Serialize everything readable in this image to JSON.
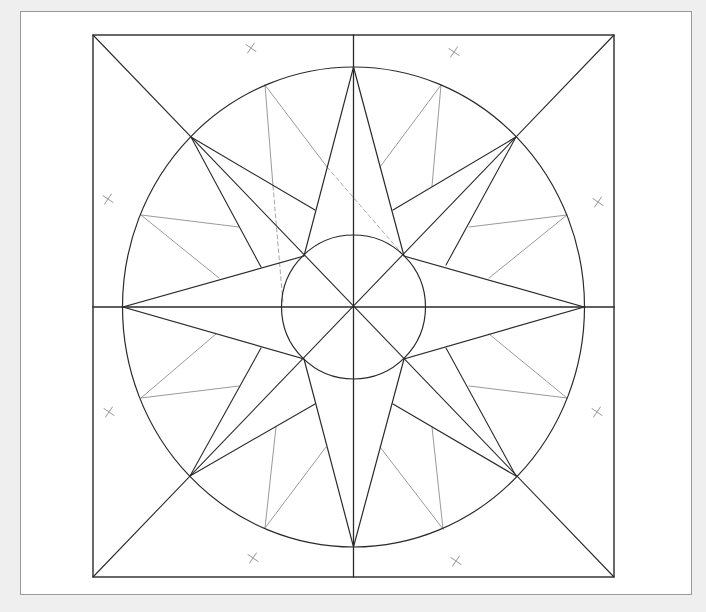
{
  "diagram": {
    "colors": {
      "background": "#efefef",
      "panel": "#ffffff",
      "panel_border": "#9a9a9a",
      "main_stroke": "#2a2a2a",
      "guide_stroke": "#9a9a9a",
      "dashed_stroke": "#a8a8a8",
      "registration_mark": "#a0a0a0"
    },
    "center": [
      353.5,
      307
    ],
    "square": {
      "x1": 93,
      "y1": 35,
      "x2": 614,
      "y2": 577
    },
    "outer_ellipse": {
      "cx": 353.5,
      "cy": 307,
      "rx": 231,
      "ry": 240
    },
    "inner_circle": {
      "cx": 353.5,
      "cy": 307,
      "r": 72
    },
    "axis_lines": [
      [
        353.5,
        35,
        353.5,
        577
      ],
      [
        93,
        307,
        614,
        307
      ]
    ],
    "diagonal_lines": [
      [
        93,
        35,
        614,
        577
      ],
      [
        614,
        35,
        93,
        577
      ]
    ],
    "main_star": {
      "description": "4-point star, cardinal tips on outer circle, inner vertices on inner circle diagonals",
      "polygon": [
        [
          353.5,
          67
        ],
        [
          404,
          256
        ],
        [
          584,
          307
        ],
        [
          404,
          359
        ],
        [
          353.5,
          547
        ],
        [
          304,
          359
        ],
        [
          123,
          307
        ],
        [
          304,
          256
        ]
      ]
    },
    "secondary_star": {
      "description": "diagonal points with base lines to main star arms",
      "points": [
        {
          "name": "NW",
          "tip": [
            191,
            137
          ],
          "bases": [
            [
              261,
              267
            ],
            [
              315,
              210
            ]
          ]
        },
        {
          "name": "NE",
          "tip": [
            516,
            137
          ],
          "bases": [
            [
              393,
              210
            ],
            [
              446,
              265
            ]
          ]
        },
        {
          "name": "SW",
          "tip": [
            190,
            476
          ],
          "bases": [
            [
              261,
              348
            ],
            [
              315,
              404
            ]
          ]
        },
        {
          "name": "SE",
          "tip": [
            516,
            476
          ],
          "bases": [
            [
              393,
              404
            ],
            [
              446,
              348
            ]
          ]
        }
      ]
    },
    "guide_points": [
      {
        "tip": [
          265,
          85
        ],
        "bases": [
          [
            273,
            186
          ],
          [
            327,
            167
          ]
        ]
      },
      {
        "tip": [
          441,
          85
        ],
        "bases": [
          [
            380,
            167
          ],
          [
            432,
            186
          ]
        ]
      },
      {
        "tip": [
          567,
          215
        ],
        "bases": [
          [
            469,
            227
          ],
          [
            489,
            278
          ]
        ]
      },
      {
        "tip": [
          567,
          398
        ],
        "bases": [
          [
            469,
            386
          ],
          [
            489,
            334
          ]
        ]
      },
      {
        "tip": [
          443,
          529
        ],
        "bases": [
          [
            432,
            427
          ],
          [
            380,
            447
          ]
        ]
      },
      {
        "tip": [
          265,
          528
        ],
        "bases": [
          [
            276,
            427
          ],
          [
            326,
            447
          ]
        ]
      },
      {
        "tip": [
          141,
          398
        ],
        "bases": [
          [
            216,
            334
          ],
          [
            239,
            386
          ]
        ]
      },
      {
        "tip": [
          141,
          215
        ],
        "bases": [
          [
            239,
            227
          ],
          [
            219,
            278
          ]
        ]
      }
    ],
    "dashed_lines": [
      [
        327,
        167,
        404,
        256
      ],
      [
        273,
        186,
        283,
        303
      ]
    ],
    "registration_marks": [
      [
        251,
        48
      ],
      [
        454,
        52
      ],
      [
        108,
        199
      ],
      [
        598,
        202
      ],
      [
        109,
        412
      ],
      [
        597,
        412
      ],
      [
        253,
        558
      ],
      [
        456,
        561
      ]
    ],
    "registration_mark_size": 6
  }
}
